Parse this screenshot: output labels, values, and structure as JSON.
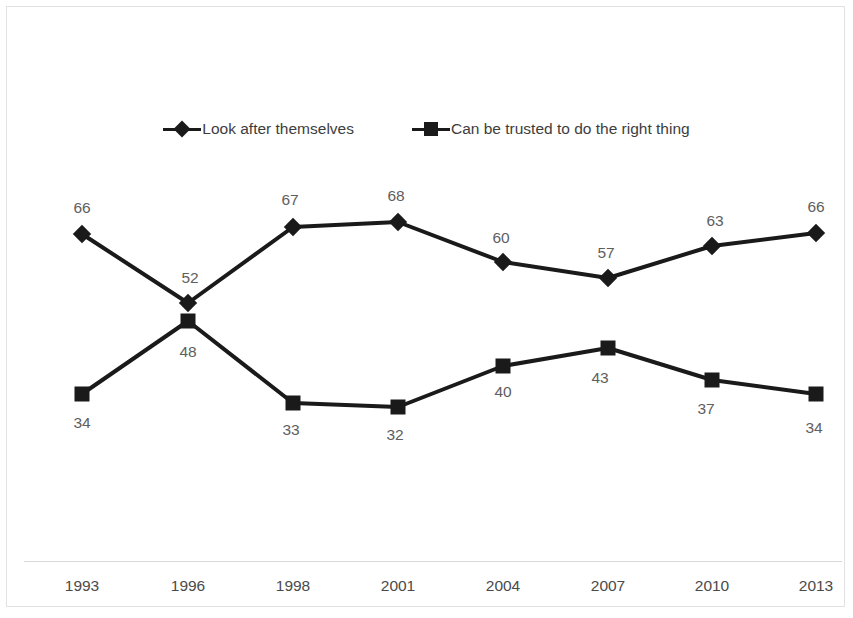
{
  "chart_data": {
    "type": "line",
    "title": "",
    "subtitle": "",
    "xlabel": "",
    "ylabel": "",
    "grid": false,
    "legend_position": "top-center",
    "categories": [
      "1993",
      "1996",
      "1998",
      "2001",
      "2004",
      "2007",
      "2010",
      "2013"
    ],
    "ylim": [
      0,
      100
    ],
    "y_axis_visible": false,
    "series": [
      {
        "name": "Look after themselves",
        "marker": "diamond",
        "color": "#1a1a1a",
        "values": [
          66,
          52,
          67,
          68,
          60,
          57,
          63,
          66
        ]
      },
      {
        "name": "Can be trusted to do the right thing",
        "marker": "square",
        "color": "#1a1a1a",
        "values": [
          34,
          48,
          33,
          32,
          40,
          43,
          37,
          34
        ]
      }
    ]
  },
  "legend": {
    "entries": [
      {
        "label": "Look after themselves",
        "marker": "diamond"
      },
      {
        "label": "Can be trusted to do the right thing",
        "marker": "square"
      }
    ]
  },
  "axis": {
    "x_tick_labels": [
      "1993",
      "1996",
      "1998",
      "2001",
      "2004",
      "2007",
      "2010",
      "2013"
    ]
  },
  "colors": {
    "series_line": "#1a1a1a",
    "data_label": "#5e5e5e",
    "axis_line": "#d9d9d9",
    "frame_border": "#e2e2e2",
    "background": "#ffffff",
    "legend_text": "#3d3d3d",
    "tick_text": "#4a4a4a"
  },
  "layout": {
    "point_x": [
      82,
      188,
      293,
      398,
      503,
      608,
      712,
      816
    ],
    "series_point_y": [
      [
        234,
        303,
        227,
        222,
        262,
        278,
        246,
        233
      ],
      [
        394,
        321,
        403,
        407,
        366,
        348,
        380,
        394
      ]
    ],
    "label_pos": [
      [
        {
          "x": 82,
          "y": 208
        },
        {
          "x": 190,
          "y": 278
        },
        {
          "x": 290,
          "y": 200
        },
        {
          "x": 396,
          "y": 196
        },
        {
          "x": 501,
          "y": 238
        },
        {
          "x": 606,
          "y": 253
        },
        {
          "x": 715,
          "y": 221
        },
        {
          "x": 816,
          "y": 207
        }
      ],
      [
        {
          "x": 82,
          "y": 423
        },
        {
          "x": 188,
          "y": 352
        },
        {
          "x": 291,
          "y": 430
        },
        {
          "x": 395,
          "y": 435
        },
        {
          "x": 503,
          "y": 392
        },
        {
          "x": 600,
          "y": 378
        },
        {
          "x": 706,
          "y": 409
        },
        {
          "x": 814,
          "y": 428
        }
      ]
    ],
    "x_label_x": [
      82,
      188,
      293,
      398,
      503,
      608,
      712,
      816
    ]
  }
}
